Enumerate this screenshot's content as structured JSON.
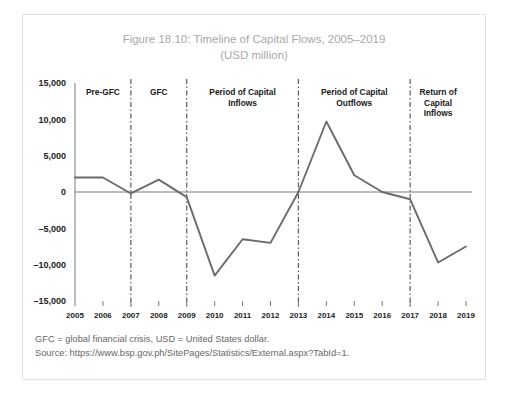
{
  "figure": {
    "title_line1": "Figure 18.10: Timeline of Capital Flows, 2005–2019",
    "title_line2": "(USD million)",
    "note": "GFC = global financial crisis, USD = United States dollar.",
    "source": "Source: https://www.bsp.gov.ph/SitePages/Statistics/External.aspx?TabId=1."
  },
  "colors": {
    "line": "#6b6b6b",
    "axis": "#7a7a7a",
    "divider": "#5a5a5a",
    "title": "#a8a8a8",
    "note": "#666666",
    "border": "#e2e2e2"
  },
  "chart_data": {
    "type": "line",
    "title": "Figure 18.10: Timeline of Capital Flows, 2005–2019",
    "subtitle": "(USD million)",
    "xlabel": "",
    "ylabel": "",
    "ylim": [
      -15000,
      15000
    ],
    "yticks": [
      15000,
      10000,
      5000,
      0,
      -5000,
      -10000,
      -15000
    ],
    "ytick_labels": [
      "15,000",
      "10,000",
      "5,000",
      "0",
      "–5,000",
      "–10,000",
      "–15,000"
    ],
    "grid": false,
    "legend": "none",
    "categories": [
      "2005",
      "2006",
      "2007",
      "2008",
      "2009",
      "2010",
      "2011",
      "2012",
      "2013",
      "2014",
      "2015",
      "2016",
      "2017",
      "2018",
      "2019"
    ],
    "series": [
      {
        "name": "Capital flows",
        "values": [
          2000,
          2000,
          -200,
          1700,
          -700,
          -11500,
          -6500,
          -7000,
          0,
          9700,
          2300,
          0,
          -1000,
          -9700,
          -7500
        ]
      }
    ],
    "annotations": [
      {
        "label": "Pre-GFC",
        "lines": [
          "Pre-GFC"
        ],
        "start": "2005",
        "end": "2007"
      },
      {
        "label": "GFC",
        "lines": [
          "GFC"
        ],
        "start": "2007",
        "end": "2009"
      },
      {
        "label": "Period of Capital Inflows",
        "lines": [
          "Period of Capital",
          "Inflows"
        ],
        "start": "2009",
        "end": "2013"
      },
      {
        "label": "Period of Capital Outflows",
        "lines": [
          "Period of Capital",
          "Outflows"
        ],
        "start": "2013",
        "end": "2017"
      },
      {
        "label": "Return of Capital Inflows",
        "lines": [
          "Return of",
          "Capital",
          "Inflows"
        ],
        "start": "2017",
        "end": "2019"
      }
    ],
    "dividers": [
      "2007",
      "2009",
      "2013",
      "2017"
    ]
  }
}
